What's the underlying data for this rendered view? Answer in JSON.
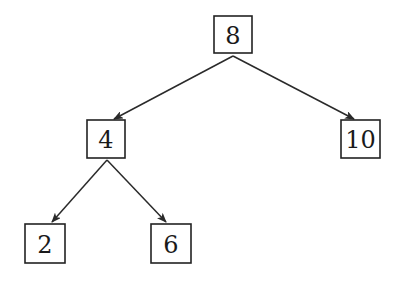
{
  "diagram": {
    "type": "binary-search-tree",
    "colors": {
      "stroke": "#222222",
      "text": "#1a1a1a",
      "background": "#ffffff"
    },
    "nodes": [
      {
        "id": "n8",
        "label": "8",
        "x": 214,
        "y": 16,
        "w": 38,
        "h": 37
      },
      {
        "id": "n4",
        "label": "4",
        "x": 87,
        "y": 120,
        "w": 38,
        "h": 38
      },
      {
        "id": "n10",
        "label": "10",
        "x": 341,
        "y": 120,
        "w": 39,
        "h": 38
      },
      {
        "id": "n2",
        "label": "2",
        "x": 25,
        "y": 224,
        "w": 40,
        "h": 39
      },
      {
        "id": "n6",
        "label": "6",
        "x": 151,
        "y": 224,
        "w": 40,
        "h": 39
      }
    ],
    "edges": [
      {
        "from": "8",
        "to": "4",
        "x1": 233,
        "y1": 56,
        "x2": 114,
        "y2": 119
      },
      {
        "from": "8",
        "to": "10",
        "x1": 233,
        "y1": 56,
        "x2": 354,
        "y2": 119
      },
      {
        "from": "4",
        "to": "2",
        "x1": 107,
        "y1": 160,
        "x2": 52,
        "y2": 222
      },
      {
        "from": "4",
        "to": "6",
        "x1": 107,
        "y1": 160,
        "x2": 166,
        "y2": 222
      }
    ]
  }
}
